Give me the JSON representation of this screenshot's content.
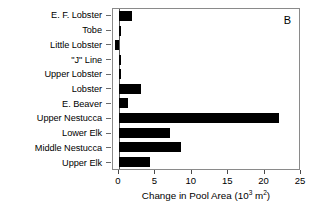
{
  "panel": {
    "letter": "B"
  },
  "chart_data": {
    "type": "bar",
    "orientation": "horizontal",
    "title": "",
    "subtitle": "",
    "panel_label": "B",
    "xlabel_parts": {
      "main": "Change in Pool Area (10",
      "exponent": "3",
      "unit": " m",
      "unit_exponent": "2",
      "close": ")"
    },
    "xlabel": "Change in Pool Area (10^3 m^2)",
    "ylabel": "",
    "categories": [
      "E. F. Lobster",
      "Tobe",
      "Little Lobster",
      "\"J\" Line",
      "Upper Lobster",
      "Lobster",
      "E. Beaver",
      "Upper Nestucca",
      "Lower Elk",
      "Middle Nestucca",
      "Upper Elk"
    ],
    "values": [
      1.8,
      0.15,
      -0.5,
      0.3,
      0.15,
      3.0,
      1.3,
      22.0,
      7.0,
      8.5,
      4.3
    ],
    "xlim": [
      0,
      25
    ],
    "xticks": [
      0,
      5,
      10,
      15,
      20,
      25
    ],
    "xtick_labels": [
      "0",
      "5",
      "10",
      "15",
      "20",
      "25"
    ],
    "grid": false,
    "legend": null,
    "bar_color": "#000000",
    "frame_color": "#8a8a8a",
    "background": "#ffffff"
  }
}
